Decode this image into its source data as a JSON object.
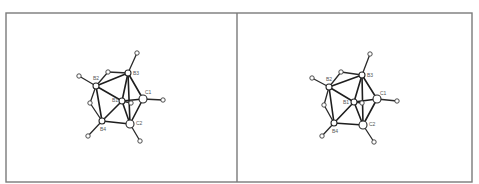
{
  "figure": {
    "type": "stereo-pair",
    "labels": [
      "B1",
      "B2",
      "B3",
      "B4",
      "C1",
      "C2"
    ]
  },
  "panels": [
    {
      "name": "left",
      "atoms": {
        "B1": {
          "x": 122,
          "y": 101,
          "label": "B1",
          "lx": 112,
          "ly": 102
        },
        "B2": {
          "x": 96,
          "y": 86,
          "label": "B2",
          "lx": 93,
          "ly": 80
        },
        "B3": {
          "x": 128,
          "y": 73,
          "label": "B3",
          "lx": 133,
          "ly": 75
        },
        "B4": {
          "x": 102,
          "y": 121,
          "label": "B4",
          "lx": 100,
          "ly": 131
        },
        "C1": {
          "x": 143,
          "y": 99,
          "label": "C1",
          "lx": 145,
          "ly": 94
        },
        "C2": {
          "x": 130,
          "y": 124,
          "label": "C2",
          "lx": 136,
          "ly": 125
        },
        "H1": {
          "x": 131,
          "y": 103
        },
        "H2": {
          "x": 90,
          "y": 103
        },
        "H3": {
          "x": 79,
          "y": 76
        },
        "H4": {
          "x": 137,
          "y": 53
        },
        "H5": {
          "x": 163,
          "y": 100
        },
        "H6": {
          "x": 140,
          "y": 141
        },
        "H7": {
          "x": 88,
          "y": 136
        },
        "Hb": {
          "x": 108,
          "y": 72
        }
      }
    },
    {
      "name": "right",
      "atoms": {
        "B1": {
          "x": 354,
          "y": 102,
          "label": "B1",
          "lx": 343,
          "ly": 104
        },
        "B2": {
          "x": 329,
          "y": 87,
          "label": "B2",
          "lx": 326,
          "ly": 81
        },
        "B3": {
          "x": 362,
          "y": 75,
          "label": "B3",
          "lx": 367,
          "ly": 77
        },
        "B4": {
          "x": 334,
          "y": 123,
          "label": "B4",
          "lx": 332,
          "ly": 133
        },
        "C1": {
          "x": 377,
          "y": 99,
          "label": "C1",
          "lx": 380,
          "ly": 95
        },
        "C2": {
          "x": 363,
          "y": 125,
          "label": "C2",
          "lx": 369,
          "ly": 126
        },
        "H1": {
          "x": 362,
          "y": 103
        },
        "H2": {
          "x": 324,
          "y": 105
        },
        "H3": {
          "x": 312,
          "y": 78
        },
        "H4": {
          "x": 370,
          "y": 54
        },
        "H5": {
          "x": 397,
          "y": 101
        },
        "H6": {
          "x": 374,
          "y": 142
        },
        "H7": {
          "x": 322,
          "y": 136
        },
        "Hb": {
          "x": 341,
          "y": 72
        }
      }
    }
  ],
  "bonds": [
    [
      "B3",
      "H4",
      "h"
    ],
    [
      "B3",
      "Hb",
      "h"
    ],
    [
      "Hb",
      "B2",
      "h"
    ],
    [
      "B2",
      "B3",
      "b"
    ],
    [
      "B2",
      "H3",
      "h"
    ],
    [
      "B2",
      "B1",
      "b"
    ],
    [
      "B3",
      "B1",
      "b"
    ],
    [
      "B3",
      "C1",
      "b"
    ],
    [
      "B3",
      "C2",
      "b"
    ],
    [
      "B1",
      "C1",
      "b"
    ],
    [
      "B1",
      "H1",
      "h"
    ],
    [
      "C1",
      "H5",
      "h"
    ],
    [
      "C1",
      "C2",
      "b"
    ],
    [
      "B1",
      "C2",
      "b"
    ],
    [
      "B2",
      "H2",
      "h"
    ],
    [
      "H2",
      "B4",
      "h"
    ],
    [
      "B2",
      "B4",
      "b"
    ],
    [
      "B1",
      "B4",
      "b"
    ],
    [
      "B4",
      "C2",
      "b"
    ],
    [
      "B4",
      "H7",
      "h"
    ],
    [
      "C2",
      "H6",
      "h"
    ]
  ],
  "frame": {
    "left": 6,
    "top": 13,
    "divider": 237,
    "right": 472,
    "bottom": 182,
    "color": "#7a7a7a"
  }
}
